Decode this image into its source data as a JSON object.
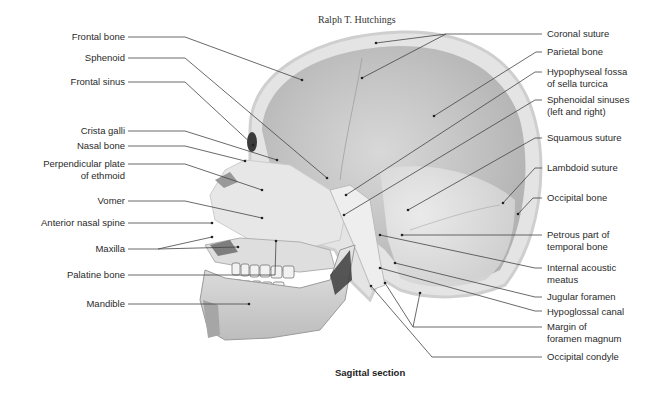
{
  "figure": {
    "credit": "Ralph T. Hutchings",
    "caption": "Sagittal section",
    "colors": {
      "background": "#ffffff",
      "leader_line": "#444444",
      "bone_light": "#e9e9e9",
      "bone_mid": "#c9c9c9",
      "cavity_dark": "#a9a9a9",
      "label_text": "#2a2a2a"
    }
  },
  "labels_left": [
    {
      "text": "Frontal bone"
    },
    {
      "text": "Sphenoid"
    },
    {
      "text": "Frontal sinus"
    },
    {
      "text": "Crista galli"
    },
    {
      "text": "Nasal bone"
    },
    {
      "text": "Perpendicular plate",
      "text2": "of ethmoid"
    },
    {
      "text": "Vomer"
    },
    {
      "text": "Anterior nasal spine"
    },
    {
      "text": "Maxilla"
    },
    {
      "text": "Palatine bone"
    },
    {
      "text": "Mandible"
    }
  ],
  "labels_right": [
    {
      "text": "Coronal suture"
    },
    {
      "text": "Parietal bone"
    },
    {
      "text": "Hypophyseal fossa",
      "text2": "of sella turcica"
    },
    {
      "text": "Sphenoidal sinuses",
      "text2": "(left and right)"
    },
    {
      "text": "Squamous suture"
    },
    {
      "text": "Lambdoid suture"
    },
    {
      "text": "Occipital bone"
    },
    {
      "text": "Petrous part of",
      "text2": "temporal bone"
    },
    {
      "text": "Internal acoustic",
      "text2": "meatus"
    },
    {
      "text": "Jugular foramen"
    },
    {
      "text": "Hypoglossal canal"
    },
    {
      "text": "Margin of",
      "text2": "foramen magnum"
    },
    {
      "text": "Occipital condyle"
    }
  ]
}
